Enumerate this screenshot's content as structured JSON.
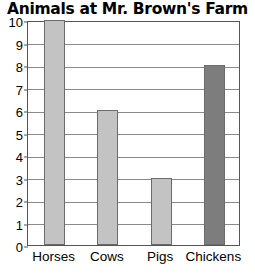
{
  "chart_data": {
    "type": "bar",
    "title": "Animals at Mr. Brown's Farm",
    "xlabel": "",
    "ylabel": "",
    "categories": [
      "Horses",
      "Cows",
      "Pigs",
      "Chickens"
    ],
    "values": [
      10,
      6,
      3,
      8
    ],
    "bar_colors": [
      "#c3c3c3",
      "#c3c3c3",
      "#c3c3c3",
      "#7d7d7d"
    ],
    "bar_edge_color": "#6b6b6b",
    "ylim": [
      0,
      10
    ],
    "yticks": [
      0,
      1,
      2,
      3,
      4,
      5,
      6,
      7,
      8,
      9,
      10
    ],
    "ytick_labels": [
      "0",
      "1",
      "2",
      "3",
      "4",
      "5",
      "6",
      "7",
      "8",
      "9",
      "10"
    ],
    "grid": true,
    "grid_color": "#8a8a8a",
    "legend": null,
    "frame_color": "#555555",
    "background": "#ffffff"
  }
}
